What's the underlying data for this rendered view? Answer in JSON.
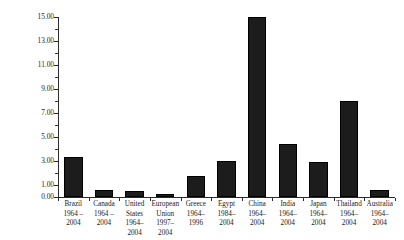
{
  "chart_data": {
    "type": "bar",
    "title": "",
    "subtitle": "",
    "xlabel": "",
    "ylabel": "Ratio of 2004 to Past Consumption (1=no change)",
    "ylim": [
      0.0,
      16.0
    ],
    "grid": false,
    "legend": null,
    "categories": [
      "Brazil 1964 – 2004",
      "Canada 1964 – 2004",
      "United States 1964–2004",
      "European Union 1997–2004",
      "Greece 1964–1996",
      "Egypt 1984–2004",
      "China 1964–2004",
      "India 1964–2004",
      "Japan 1964–2004",
      "Thailand 1964–2004",
      "Australia 1964–2004"
    ],
    "values": [
      3.35,
      0.6,
      0.5,
      0.25,
      1.75,
      3.0,
      15.0,
      4.45,
      2.9,
      8.0,
      0.6
    ],
    "ytick_values": [
      0.0,
      1.0,
      3.0,
      5.0,
      7.0,
      9.0,
      11.0,
      13.0,
      15.0
    ],
    "ytick_labels": [
      "0.00",
      "1.00",
      "3.00",
      "5.00",
      "7.00",
      "9.00",
      "11.00",
      "13.00",
      "15.00"
    ],
    "ytick_minor_values": [
      2.0,
      4.0,
      6.0,
      8.0,
      10.0,
      12.0,
      14.0,
      16.0
    ],
    "bar_color": "#1c1c1c",
    "axis_color": "#2b2b2b"
  },
  "axis": {
    "y_title": "Ratio of 2004 to Past Consumption (1=no change)"
  },
  "categories_lines": [
    [
      "Brazil",
      "1964 –",
      "2004"
    ],
    [
      "Canada",
      "1964 –",
      "2004"
    ],
    [
      "United",
      "States",
      "1964–",
      "2004"
    ],
    [
      "European",
      "Union",
      "1997–",
      "2004"
    ],
    [
      "Greece",
      "1964–",
      "1996"
    ],
    [
      "Egypt",
      "1984–",
      "2004"
    ],
    [
      "China",
      "1964–",
      "2004"
    ],
    [
      "India",
      "1964–",
      "2004"
    ],
    [
      "Japan",
      "1964–",
      "2004"
    ],
    [
      "Thailand",
      "1964–",
      "2004"
    ],
    [
      "Australia",
      "1964–",
      "2004"
    ]
  ]
}
